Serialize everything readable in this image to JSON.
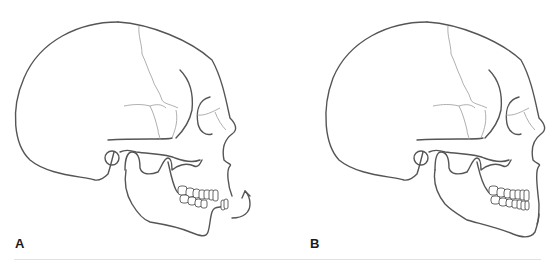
{
  "figure": {
    "panels": [
      {
        "id": "A",
        "label": "A",
        "description": "Lateral skull view, mandible rotating closed",
        "annotation": "curved-rotation-arrow"
      },
      {
        "id": "B",
        "label": "B",
        "description": "Lateral skull view, mandible in occlusion",
        "annotation": ""
      }
    ],
    "caption": "",
    "colors": {
      "line": "#555555",
      "suture": "#9a9a9a",
      "label": "#1a1a1a",
      "background": "#ffffff"
    }
  }
}
